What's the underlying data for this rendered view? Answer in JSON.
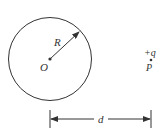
{
  "diagram": {
    "colors": {
      "stroke": "#333333",
      "background": "#ffffff"
    },
    "sphere": {
      "center_label": "O",
      "radius_label": "R"
    },
    "charge": {
      "charge_label": "+q",
      "point_label": "P"
    },
    "distance": {
      "label": "d"
    }
  }
}
